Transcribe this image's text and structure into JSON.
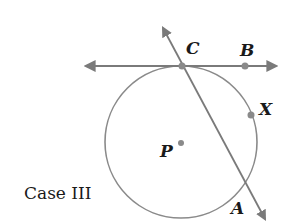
{
  "diagram": {
    "caption": "Case III",
    "labels": {
      "C": "C",
      "B": "B",
      "X": "X",
      "P": "P",
      "A": "A"
    },
    "colors": {
      "line": "#7a7a7a",
      "point": "#8a8a8a",
      "text": "#1a1a1a"
    },
    "elements": [
      "circle centered at P",
      "tangent line through C and B (line with arrows both ends)",
      "secant through C and A (line with arrows both ends)",
      "point X on circle"
    ]
  }
}
